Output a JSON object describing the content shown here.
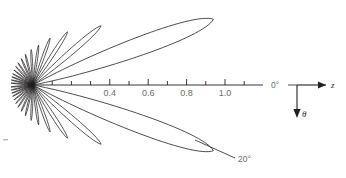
{
  "figure": {
    "kind": "polar-radiation-pattern",
    "background": "#ffffff",
    "curve_color": "#231f20",
    "axis_color": "#231f20",
    "label_color": "#6d6e71"
  },
  "axis": {
    "name": "radial-distance-axis",
    "origin_px": [
      33,
      85
    ],
    "unit_px_per_1_0": 192,
    "major_ticks": [
      0.4,
      0.6,
      0.8,
      1.0
    ],
    "major_tick_labels": [
      "0.4",
      "0.6",
      "0.8",
      "1.0"
    ],
    "minor_ticks": [
      0.1,
      0.2,
      0.3,
      0.5,
      0.7,
      0.9,
      1.1
    ],
    "axis_end": 1.2
  },
  "labels": {
    "zero_degree": "0°",
    "twenty_degree": "20°",
    "z_axis": "z",
    "theta": "θ"
  },
  "chart_data": {
    "type": "line",
    "title": "",
    "xlabel": "",
    "ylabel": "",
    "grid": false,
    "legend": null,
    "coordinate_system": "polar",
    "angle_labels_deg": [
      0,
      20
    ],
    "radial_tick_values": [
      0.4,
      0.6,
      0.8,
      1.0
    ],
    "radial_tick_labels": [
      "0.4",
      "0.6",
      "0.8",
      "1.0"
    ],
    "lobes": [
      {
        "angle_deg": -20,
        "radius": 1.0,
        "half_width_deg": 9.0,
        "name": "main-lobe-upper"
      },
      {
        "angle_deg": 20,
        "radius": 1.0,
        "half_width_deg": 9.0,
        "name": "main-lobe-lower"
      },
      {
        "angle_deg": -41,
        "radius": 0.47,
        "half_width_deg": 6.0,
        "name": "sidelobe-upper-1"
      },
      {
        "angle_deg": 41,
        "radius": 0.47,
        "half_width_deg": 6.0,
        "name": "sidelobe-lower-1"
      },
      {
        "angle_deg": -57,
        "radius": 0.33,
        "half_width_deg": 5.2,
        "name": "sidelobe-upper-2"
      },
      {
        "angle_deg": 57,
        "radius": 0.33,
        "half_width_deg": 5.2,
        "name": "sidelobe-lower-2"
      },
      {
        "angle_deg": -70,
        "radius": 0.26,
        "half_width_deg": 4.6,
        "name": "sidelobe-upper-3"
      },
      {
        "angle_deg": 70,
        "radius": 0.26,
        "half_width_deg": 4.6,
        "name": "sidelobe-lower-3"
      },
      {
        "angle_deg": -82,
        "radius": 0.21,
        "half_width_deg": 4.2,
        "name": "sidelobe-upper-4"
      },
      {
        "angle_deg": 82,
        "radius": 0.21,
        "half_width_deg": 4.2,
        "name": "sidelobe-lower-4"
      },
      {
        "angle_deg": -93,
        "radius": 0.185,
        "half_width_deg": 4.0,
        "name": "sidelobe-upper-5"
      },
      {
        "angle_deg": 93,
        "radius": 0.185,
        "half_width_deg": 4.0,
        "name": "sidelobe-lower-5"
      },
      {
        "angle_deg": -104,
        "radius": 0.165,
        "half_width_deg": 3.8,
        "name": "sidelobe-upper-6"
      },
      {
        "angle_deg": 104,
        "radius": 0.165,
        "half_width_deg": 3.8,
        "name": "sidelobe-lower-6"
      },
      {
        "angle_deg": -114,
        "radius": 0.15,
        "half_width_deg": 3.6,
        "name": "sidelobe-upper-7"
      },
      {
        "angle_deg": 114,
        "radius": 0.15,
        "half_width_deg": 3.6,
        "name": "sidelobe-lower-7"
      },
      {
        "angle_deg": -124,
        "radius": 0.14,
        "half_width_deg": 3.5,
        "name": "sidelobe-upper-8"
      },
      {
        "angle_deg": 124,
        "radius": 0.14,
        "half_width_deg": 3.5,
        "name": "sidelobe-lower-8"
      },
      {
        "angle_deg": -133,
        "radius": 0.132,
        "half_width_deg": 3.4,
        "name": "sidelobe-upper-9"
      },
      {
        "angle_deg": 133,
        "radius": 0.132,
        "half_width_deg": 3.4,
        "name": "sidelobe-lower-9"
      },
      {
        "angle_deg": -142,
        "radius": 0.126,
        "half_width_deg": 3.3,
        "name": "sidelobe-upper-10"
      },
      {
        "angle_deg": 142,
        "radius": 0.126,
        "half_width_deg": 3.3,
        "name": "sidelobe-lower-10"
      },
      {
        "angle_deg": -151,
        "radius": 0.121,
        "half_width_deg": 3.2,
        "name": "sidelobe-upper-11"
      },
      {
        "angle_deg": 151,
        "radius": 0.121,
        "half_width_deg": 3.2,
        "name": "sidelobe-lower-11"
      },
      {
        "angle_deg": -159,
        "radius": 0.118,
        "half_width_deg": 3.1,
        "name": "sidelobe-upper-12"
      },
      {
        "angle_deg": 159,
        "radius": 0.118,
        "half_width_deg": 3.1,
        "name": "sidelobe-lower-12"
      },
      {
        "angle_deg": -167,
        "radius": 0.116,
        "half_width_deg": 3.0,
        "name": "sidelobe-upper-13"
      },
      {
        "angle_deg": 167,
        "radius": 0.116,
        "half_width_deg": 3.0,
        "name": "sidelobe-lower-13"
      },
      {
        "angle_deg": -175,
        "radius": 0.115,
        "half_width_deg": 3.0,
        "name": "sidelobe-upper-14"
      },
      {
        "angle_deg": 175,
        "radius": 0.115,
        "half_width_deg": 3.0,
        "name": "sidelobe-lower-14"
      }
    ]
  }
}
